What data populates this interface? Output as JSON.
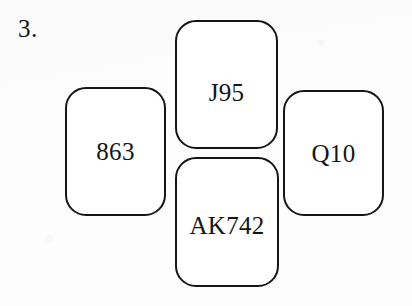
{
  "figure": {
    "item_number": "3.",
    "background_color": "#fdfdfd",
    "stroke_color": "#151515",
    "card_fill": "#ffffff",
    "text_color": "#141414",
    "arrangement": "cross",
    "cards": [
      {
        "position": "top",
        "label": "J95"
      },
      {
        "position": "left",
        "label": "863"
      },
      {
        "position": "right",
        "label": "Q10"
      },
      {
        "position": "bottom",
        "label": "AK742"
      }
    ]
  }
}
